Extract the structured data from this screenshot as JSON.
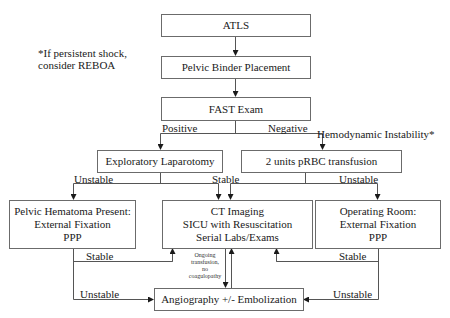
{
  "diagram": {
    "type": "flowchart",
    "note_reboa": {
      "line1": "*If persistent shock,",
      "line2": "consider REBOA"
    },
    "nodes": {
      "atls": {
        "lines": [
          "ATLS"
        ]
      },
      "pelvic_binder": {
        "lines": [
          "Pelvic Binder Placement"
        ]
      },
      "fast_exam": {
        "lines": [
          "FAST Exam"
        ]
      },
      "ex_lap": {
        "lines": [
          "Exploratory Laparotomy"
        ]
      },
      "prbc": {
        "lines": [
          "2 units pRBC transfusion"
        ]
      },
      "pelvic_hematoma": {
        "lines": [
          "Pelvic Hematoma Present:",
          "External Fixation",
          "PPP"
        ]
      },
      "ct_imaging": {
        "lines": [
          "CT Imaging",
          "SICU with Resuscitation",
          "Serial Labs/Exams"
        ]
      },
      "operating_room": {
        "lines": [
          "Operating Room:",
          "External Fixation",
          "PPP"
        ]
      },
      "angiography": {
        "lines": [
          "Angiography +/- Embolization"
        ]
      }
    },
    "edge_labels": {
      "positive": "Positive",
      "negative": "Negative",
      "hemodynamic_instability": "Hemodynamic Instability*",
      "exlap_unstable": "Unstable",
      "stable_center": "Stable",
      "prbc_unstable": "Unstable",
      "hematoma_stable": "Stable",
      "hematoma_unstable": "Unstable",
      "or_stable": "Stable",
      "or_unstable": "Unstable",
      "ongoing": [
        "Ongoing",
        "transfusion,",
        "no",
        "coagulopathy"
      ]
    },
    "edges": [
      [
        "ATLS",
        "Pelvic Binder Placement"
      ],
      [
        "Pelvic Binder Placement",
        "FAST Exam"
      ],
      [
        "FAST Exam",
        "Exploratory Laparotomy",
        "Positive"
      ],
      [
        "FAST Exam",
        "2 units pRBC transfusion",
        "Negative"
      ],
      [
        "Exploratory Laparotomy",
        "Pelvic Hematoma Present",
        "Unstable"
      ],
      [
        "Exploratory Laparotomy",
        "CT Imaging",
        "Stable"
      ],
      [
        "2 units pRBC transfusion",
        "CT Imaging",
        "Stable"
      ],
      [
        "2 units pRBC transfusion",
        "Operating Room",
        "Unstable"
      ],
      [
        "Pelvic Hematoma Present",
        "CT Imaging",
        "Stable"
      ],
      [
        "Pelvic Hematoma Present",
        "Angiography +/- Embolization",
        "Unstable"
      ],
      [
        "Operating Room",
        "CT Imaging",
        "Stable"
      ],
      [
        "Operating Room",
        "Angiography +/- Embolization",
        "Unstable"
      ],
      [
        "CT Imaging",
        "Angiography +/- Embolization",
        "Ongoing transfusion, no coagulopathy"
      ],
      [
        "Angiography +/- Embolization",
        "CT Imaging"
      ]
    ]
  }
}
